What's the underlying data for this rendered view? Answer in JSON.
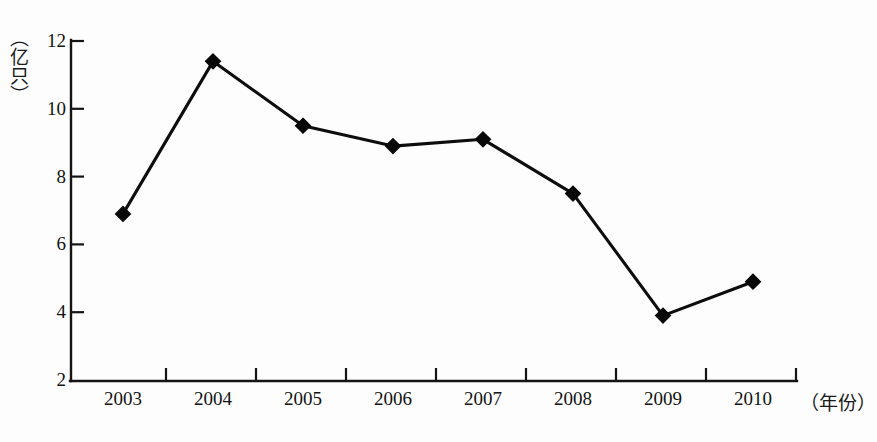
{
  "chart_data": {
    "type": "line",
    "title": "",
    "subtitle": "",
    "xlabel": "（年份）",
    "ylabel": "（亿只）",
    "categories": [
      "2003",
      "2004",
      "2005",
      "2006",
      "2007",
      "2008",
      "2009",
      "2010"
    ],
    "values": [
      6.9,
      11.4,
      9.5,
      8.9,
      9.1,
      7.5,
      3.9,
      4.9
    ],
    "series": [
      {
        "name": "",
        "values": [
          6.9,
          11.4,
          9.5,
          8.9,
          9.1,
          7.5,
          3.9,
          4.9
        ]
      }
    ],
    "ylim": [
      2,
      12
    ],
    "yticks": [
      2,
      4,
      6,
      8,
      10,
      12
    ],
    "ytick_labels": [
      "2",
      "4",
      "6",
      "8",
      "10",
      "12"
    ],
    "xtick_labels": [
      "2003",
      "2004",
      "2005",
      "2006",
      "2007",
      "2008",
      "2009",
      "2010"
    ],
    "grid": false,
    "legend": null,
    "legend_position": "none",
    "marker": "diamond",
    "line_color": "#0d0d0d",
    "marker_color": "#080808",
    "axis_color": "#141414",
    "background_color": "#fdfdfd"
  },
  "axis": {
    "y_unit_label": "（亿只）",
    "x_unit_label": "（年份）"
  }
}
